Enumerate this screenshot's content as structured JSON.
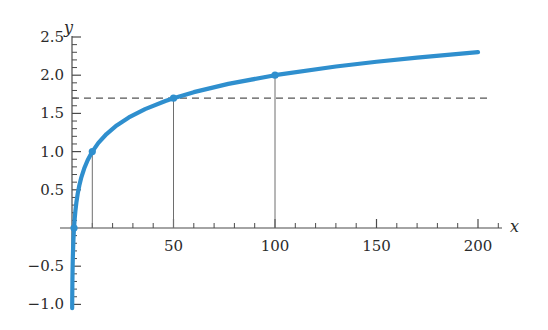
{
  "chart_data": {
    "type": "line",
    "title": "",
    "xlabel": "x",
    "ylabel": "y",
    "xlim": [
      0,
      212
    ],
    "ylim": [
      -1.05,
      2.55
    ],
    "grid": false,
    "legend": null,
    "curve_formula": "y = log10(x)",
    "x_ticks_major": [
      50,
      100,
      150,
      200
    ],
    "x_tick_labels": [
      "50",
      "100",
      "150",
      "200"
    ],
    "x_ticks_minor": [
      10,
      20,
      30,
      40,
      60,
      70,
      80,
      90,
      110,
      120,
      130,
      140,
      160,
      170,
      180,
      190,
      210
    ],
    "y_ticks_major": [
      -1.0,
      -0.5,
      0.5,
      1.0,
      1.5,
      2.0,
      2.5
    ],
    "y_tick_labels": [
      "-1.0",
      "-0.5",
      "0.5",
      "1.0",
      "1.5",
      "2.0",
      "2.5"
    ],
    "y_ticks_minor": [
      -0.9,
      -0.8,
      -0.7,
      -0.6,
      -0.4,
      -0.3,
      -0.2,
      -0.1,
      0.1,
      0.2,
      0.3,
      0.4,
      0.6,
      0.7,
      0.8,
      0.9,
      1.1,
      1.2,
      1.3,
      1.4,
      1.6,
      1.7,
      1.8,
      1.9,
      2.1,
      2.2,
      2.3,
      2.4
    ],
    "series": [
      {
        "name": "log10(x)",
        "color": "#2f8fce",
        "x": [
          0.089,
          0.1,
          0.12,
          0.15,
          0.2,
          0.26,
          0.33,
          0.42,
          0.55,
          0.7,
          0.9,
          1.0,
          1.3,
          1.7,
          2.2,
          2.8,
          3.6,
          4.6,
          6.0,
          7.7,
          10.0,
          13,
          17,
          22,
          28,
          36,
          46,
          50,
          60,
          77,
          100,
          130,
          150,
          170,
          200
        ],
        "y": [
          -1.05,
          -1.0,
          -0.921,
          -0.824,
          -0.699,
          -0.585,
          -0.481,
          -0.377,
          -0.26,
          -0.155,
          -0.046,
          0.0,
          0.114,
          0.23,
          0.342,
          0.447,
          0.556,
          0.663,
          0.778,
          0.886,
          1.0,
          1.114,
          1.23,
          1.342,
          1.447,
          1.556,
          1.663,
          1.699,
          1.778,
          1.886,
          2.0,
          2.114,
          2.176,
          2.23,
          2.301
        ]
      }
    ],
    "markers": [
      {
        "label": "origin-marker",
        "x": 1,
        "y": 0.0,
        "drop_line": false
      },
      {
        "label": "marker-x10",
        "x": 10,
        "y": 1.0,
        "drop_line": true
      },
      {
        "label": "marker-x50",
        "x": 50,
        "y": 1.699,
        "drop_line": true
      },
      {
        "label": "marker-x100",
        "x": 100,
        "y": 2.0,
        "drop_line": true
      }
    ],
    "reference_lines": [
      {
        "name": "horizontal-dashed-reference",
        "orientation": "horizontal",
        "y": 1.699,
        "x_start": 0,
        "x_end": 205,
        "style": "dashed",
        "color": "#555555"
      }
    ],
    "marker_color": "#2f8fce",
    "axis_color": "#4a4a4a",
    "curve_color": "#2f8fce"
  }
}
